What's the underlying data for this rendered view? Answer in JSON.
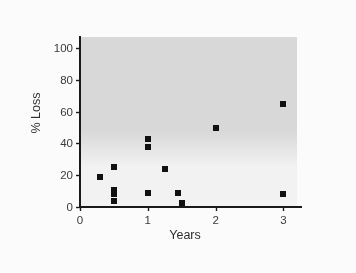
{
  "chart_data": {
    "type": "scatter",
    "title": "",
    "xlabel": "Years",
    "ylabel": "% Loss",
    "xlim": [
      0,
      3.2
    ],
    "ylim": [
      0,
      107
    ],
    "xticks": [
      0,
      1,
      2,
      3
    ],
    "xtick_labels": [
      "0",
      "1",
      "2",
      "3"
    ],
    "yticks": [
      0,
      20,
      40,
      60,
      80,
      100
    ],
    "ytick_labels": [
      "0",
      "20",
      "40",
      "60",
      "80",
      "100"
    ],
    "grid": false,
    "legend": "none",
    "marker_style": "filled-square",
    "marker_color": "#111111",
    "plot_background": "#f2f2f2",
    "shaded_upper_region": {
      "color": "#d8d8d8",
      "from_y": 44,
      "to_y": 107,
      "note": "light gray band across upper portion of plot area"
    },
    "points": [
      {
        "x": 0.3,
        "y": 19
      },
      {
        "x": 0.5,
        "y": 25
      },
      {
        "x": 0.5,
        "y": 11
      },
      {
        "x": 0.5,
        "y": 8
      },
      {
        "x": 0.5,
        "y": 4
      },
      {
        "x": 1.0,
        "y": 43
      },
      {
        "x": 1.0,
        "y": 38
      },
      {
        "x": 1.0,
        "y": 9
      },
      {
        "x": 1.25,
        "y": 24
      },
      {
        "x": 1.45,
        "y": 9
      },
      {
        "x": 1.5,
        "y": 2.5
      },
      {
        "x": 2.0,
        "y": 50
      },
      {
        "x": 3.0,
        "y": 65
      },
      {
        "x": 3.0,
        "y": 8
      }
    ],
    "n_points": 14
  },
  "figure": {
    "background": "#fbfbfb",
    "axis_color": "#1a1a1a"
  }
}
